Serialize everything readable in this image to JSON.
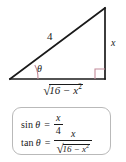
{
  "figure": {
    "type": "right-triangle-trig-diagram",
    "triangle": {
      "hypotenuse_label": "4",
      "opposite_label": "x",
      "adjacent_label": {
        "radical_sign": "√",
        "radicand_base": "16 − x",
        "radicand_exponent": "2"
      },
      "angle_label": "θ",
      "right_angle_marker": "square",
      "line_color": "#1a1a1a",
      "angle_arc_color": "#c18a99",
      "right_angle_color": "#c18a99"
    },
    "formula_box": {
      "border_color": "#b9b9b9",
      "rows": [
        {
          "function": "sin",
          "variable": "θ",
          "equals": "=",
          "numerator": "x",
          "denominator": "4"
        },
        {
          "function": "tan",
          "variable": "θ",
          "equals": "=",
          "numerator": "x",
          "denominator_radical_sign": "√",
          "denominator_radicand_base": "16 − x",
          "denominator_radicand_exponent": "2"
        }
      ]
    }
  }
}
